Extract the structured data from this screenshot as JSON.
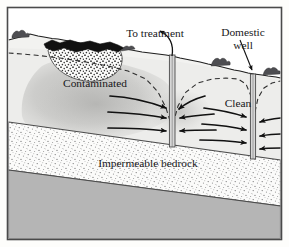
{
  "figure": {
    "frame_color": "#4a4a4a",
    "background_color": "#fdfdfb"
  },
  "labels": {
    "to_treatment": "To treatment",
    "domestic_well_line1": "Domestic",
    "domestic_well_line2": "well",
    "contaminated": "Contaminated",
    "clean": "Clean",
    "impermeable_bedrock": "Impermeable bedrock"
  },
  "colors": {
    "outline": "#2b2b2b",
    "ground_surface": "#f2f2f0",
    "aquifer_fill": "#ededeb",
    "plume_fill": "#c9c9c7",
    "plume_core": "#bdbdbb",
    "landfill_cap": "#1a1a1a",
    "landfill_waste": "#fafafa",
    "bedrock_stipple_bg": "#fbfbfa",
    "bedrock_lower": "#b5b5b5",
    "water_table_dash": "#3a3a3a",
    "arrow": "#111111",
    "well_casing": "#8d8d8d",
    "vegetation": "#55555a"
  },
  "elements": {
    "extraction_well": {
      "name": "extraction-well",
      "label_ref": "to_treatment",
      "x": 172,
      "top_y": 56,
      "bottom_y": 146
    },
    "domestic_well": {
      "name": "domestic-well",
      "label_ref": "domestic_well_line1",
      "x": 253,
      "top_y": 75,
      "bottom_y": 158
    },
    "landfill": {
      "name": "landfill-source",
      "cap_color": "#1a1a1a",
      "waste_pattern": "stipple"
    },
    "layers": [
      {
        "name": "unsaturated-zone",
        "fill": "#f2f2f0"
      },
      {
        "name": "aquifer",
        "fill": "#ededeb"
      },
      {
        "name": "impermeable-bedrock",
        "fill": "#fbfbfa",
        "pattern": "stipple"
      },
      {
        "name": "lower-bedrock",
        "fill": "#b5b5b5"
      }
    ],
    "flow_arrows": {
      "name": "groundwater-flow-arrows",
      "left_of_extraction_well": 3,
      "right_of_extraction_well": 3,
      "between_wells": 3,
      "right_of_domestic_well": 3,
      "direction_note": "converging toward wells"
    },
    "water_table": {
      "name": "water-table-line",
      "style": "dashed",
      "cones_of_depression": 2
    }
  }
}
